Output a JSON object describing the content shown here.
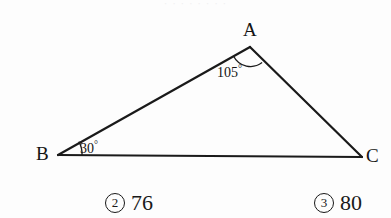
{
  "figure": {
    "type": "triangle-diagram",
    "background_color": "#fdfdfd",
    "stroke_color": "#1a1a1a",
    "vertices": [
      {
        "name": "A",
        "label": "A",
        "x": 250,
        "y": 47
      },
      {
        "name": "B",
        "label": "B",
        "x": 58,
        "y": 155
      },
      {
        "name": "C",
        "label": "C",
        "x": 362,
        "y": 157
      }
    ],
    "angles": [
      {
        "at": "A",
        "value": "105",
        "degree_symbol": "°",
        "text": "105°"
      },
      {
        "at": "B",
        "value": "30",
        "degree_symbol": "°",
        "text": "30°"
      }
    ],
    "sides": [
      {
        "from": "B",
        "to": "A"
      },
      {
        "from": "A",
        "to": "C"
      },
      {
        "from": "B",
        "to": "C"
      }
    ]
  },
  "top_clip": {
    "text": "· · · · · · · ·"
  },
  "choices": [
    {
      "marker": "2",
      "number": "76"
    },
    {
      "marker": "3",
      "number": "80"
    }
  ]
}
